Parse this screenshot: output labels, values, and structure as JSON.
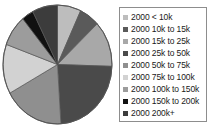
{
  "chart_data": {
    "type": "pie",
    "title": "",
    "xlabel": "",
    "ylabel": "",
    "legend_position": "right",
    "grid": false,
    "categories": [
      "2000 < 10k",
      "2000 10k to 15k",
      "2000 15k to 25k",
      "2000 25k to 50k",
      "2000 50k to 75k",
      "2000 75k to 100k",
      "2000 100k to 150k",
      "2000 150k to 200k",
      "2000 200k+"
    ],
    "values": [
      7.0,
      6.0,
      12.5,
      23.5,
      18.0,
      13.5,
      8.5,
      3.5,
      7.5
    ],
    "units": "percent",
    "colors": [
      "#bdbdbd",
      "#5a5a5a",
      "#a8a8a8",
      "#4a4a4a",
      "#8f8f8f",
      "#d2d2d2",
      "#9c9c9c",
      "#111111",
      "#3c3c3c"
    ],
    "start_angle_deg": 0,
    "direction": "clockwise"
  },
  "legend": {
    "items": [
      {
        "label": "2000 < 10k",
        "swatch": "#bdbdbd"
      },
      {
        "label": "2000 10k to 15k",
        "swatch": "#5a5a5a"
      },
      {
        "label": "2000 15k to 25k",
        "swatch": "#a8a8a8"
      },
      {
        "label": "2000 25k to 50k",
        "swatch": "#4a4a4a"
      },
      {
        "label": "2000 50k to 75k",
        "swatch": "#8f8f8f"
      },
      {
        "label": "2000 75k to 100k",
        "swatch": "#d2d2d2"
      },
      {
        "label": "2000 100k to 150k",
        "swatch": "#9c9c9c"
      },
      {
        "label": "2000 150k to 200k",
        "swatch": "#111111"
      },
      {
        "label": "2000 200k+",
        "swatch": "#3c3c3c"
      }
    ]
  },
  "style": {
    "pie_outline": "#555555",
    "legend_border": "#8d8d8d",
    "background": "#ffffff"
  }
}
